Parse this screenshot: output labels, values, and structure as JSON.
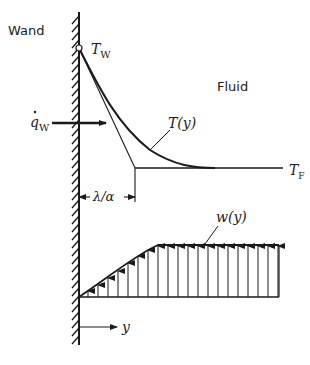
{
  "labels": {
    "wall": "Wand",
    "fluid": "Fluid",
    "wall_temp": "T",
    "wall_temp_sub": "W",
    "heat_flux": "q",
    "heat_flux_sub": "W",
    "temp_profile": "T(y)",
    "fluid_temp": "T",
    "fluid_temp_sub": "F",
    "thickness": "λ/α",
    "velocity_profile": "w(y)",
    "coordinate": "y"
  },
  "colors": {
    "ink": "#1a1a1a",
    "background": "#ffffff"
  }
}
